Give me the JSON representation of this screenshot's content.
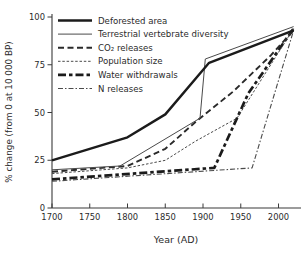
{
  "figure": {
    "background": "#ffffff",
    "axis_color": "#3a3a3a",
    "text_color": "#2b2b2b"
  },
  "chart_data": {
    "type": "line",
    "title": "",
    "xlabel": "Year (AD)",
    "ylabel": "% change (from 0 at 10 000 BP)",
    "xlim": [
      1700,
      2025
    ],
    "ylim": [
      0,
      100
    ],
    "x_ticks": [
      "1700",
      "1750",
      "1800",
      "1850",
      "1900",
      "1950",
      "2000"
    ],
    "x_tick_values": [
      1700,
      1750,
      1800,
      1850,
      1900,
      1950,
      2000
    ],
    "y_ticks": [
      "0",
      "25",
      "50",
      "75",
      "100"
    ],
    "y_tick_values": [
      0,
      25,
      50,
      75,
      100
    ],
    "grid": false,
    "legend_position": "top-left-inside",
    "series": [
      {
        "name": "Deforested area",
        "style": "solid-thick",
        "color": "#1b1b1b",
        "width": 2.4,
        "dash": "",
        "points": [
          [
            1700,
            25
          ],
          [
            1800,
            37
          ],
          [
            1850,
            49
          ],
          [
            1908,
            76
          ],
          [
            2020,
            93
          ]
        ]
      },
      {
        "name": "Terrestrial vertebrate diversity",
        "style": "solid-thin",
        "color": "#4a4a4a",
        "width": 1,
        "dash": "",
        "points": [
          [
            1700,
            20
          ],
          [
            1790,
            22
          ],
          [
            1896,
            47
          ],
          [
            1903,
            78
          ],
          [
            2020,
            95
          ]
        ]
      },
      {
        "name": "CO₂ releases",
        "style": "dashed-thick",
        "color": "#2a2a2a",
        "width": 1.9,
        "dash": "6,3.5",
        "points": [
          [
            1700,
            19
          ],
          [
            1800,
            22
          ],
          [
            1850,
            31
          ],
          [
            1890,
            45
          ],
          [
            1940,
            61
          ],
          [
            1990,
            80
          ],
          [
            2020,
            93
          ]
        ]
      },
      {
        "name": "Population size",
        "style": "dashed-fine",
        "color": "#4a4a4a",
        "width": 1,
        "dash": "2.5,1.8",
        "points": [
          [
            1700,
            18
          ],
          [
            1800,
            21
          ],
          [
            1850,
            25
          ],
          [
            1890,
            35
          ],
          [
            1945,
            47
          ],
          [
            2020,
            94
          ]
        ]
      },
      {
        "name": "Water withdrawals",
        "style": "dash-dot-thick",
        "color": "#1b1b1b",
        "width": 2.7,
        "dash": "8,3,3.5,3",
        "points": [
          [
            1700,
            15
          ],
          [
            1915,
            21
          ],
          [
            1960,
            60
          ],
          [
            2020,
            94
          ]
        ]
      },
      {
        "name": "N releases",
        "style": "dash-dot-thin",
        "color": "#4a4a4a",
        "width": 1.1,
        "dash": "5,2,1.5,2",
        "points": [
          [
            1700,
            14
          ],
          [
            1965,
            21
          ],
          [
            2020,
            93
          ]
        ]
      }
    ]
  }
}
